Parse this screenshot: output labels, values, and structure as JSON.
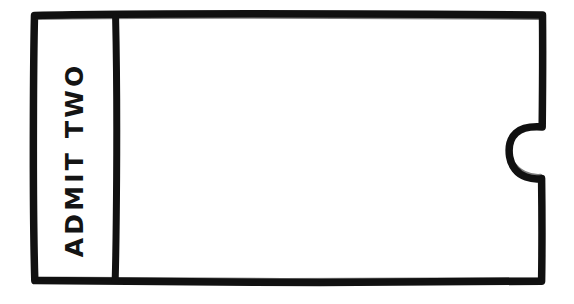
{
  "image": {
    "kind": "hand-drawn-sketch",
    "subject": "admission ticket",
    "background_color": "#ffffff",
    "ink_color": "#111111"
  },
  "ticket": {
    "stub": {
      "label": "ADMIT TWO",
      "text_orientation": "rotated-90-counterclockwise",
      "divider_name": "tear-line"
    },
    "body": {
      "content": "",
      "notch": {
        "name": "notch-right",
        "shape": "semicircle",
        "edge": "right",
        "opening": "inward"
      }
    }
  }
}
